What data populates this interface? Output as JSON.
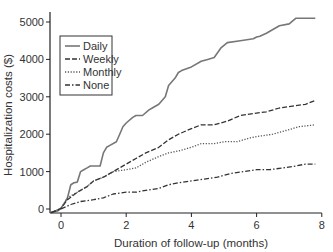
{
  "chart_data": {
    "type": "line",
    "title": "",
    "xlabel": "Duration of follow-up (months)",
    "ylabel": "Hospitalization costs ($)",
    "xlim": [
      -0.35,
      8
    ],
    "ylim": [
      -150,
      5300
    ],
    "xticks": [
      0,
      2,
      4,
      6,
      8
    ],
    "yticks": [
      0,
      1000,
      2000,
      3000,
      4000,
      5000
    ],
    "grid": false,
    "legend_position": "upper left",
    "series": [
      {
        "name": "Daily",
        "style": "solid",
        "color": "#777777",
        "x": [
          -0.3,
          -0.1,
          0.0,
          0.1,
          0.2,
          0.3,
          0.4,
          0.5,
          0.6,
          0.7,
          0.8,
          0.9,
          1.0,
          1.2,
          1.3,
          1.4,
          1.5,
          1.7,
          1.8,
          1.9,
          2.0,
          2.2,
          2.3,
          2.5,
          2.7,
          2.8,
          3.0,
          3.2,
          3.3,
          3.5,
          3.6,
          3.7,
          4.0,
          4.3,
          4.5,
          4.7,
          4.9,
          5.1,
          5.5,
          5.9,
          6.0,
          6.1,
          6.3,
          6.5,
          6.7,
          7.0,
          7.2,
          7.5,
          7.8
        ],
        "y": [
          -100,
          -50,
          20,
          150,
          300,
          650,
          700,
          720,
          1000,
          1050,
          1100,
          1150,
          1150,
          1150,
          1500,
          1650,
          1700,
          1800,
          2000,
          2200,
          2300,
          2450,
          2500,
          2500,
          2650,
          2700,
          2800,
          3000,
          3300,
          3500,
          3650,
          3700,
          3800,
          3950,
          4000,
          4050,
          4300,
          4450,
          4500,
          4550,
          4600,
          4620,
          4700,
          4800,
          4900,
          4950,
          5100,
          5100,
          5100
        ]
      },
      {
        "name": "Weekly",
        "style": "dashed",
        "color": "#333333",
        "x": [
          -0.3,
          0.0,
          0.2,
          0.5,
          0.8,
          1.0,
          1.3,
          1.6,
          2.0,
          2.3,
          2.6,
          3.0,
          3.3,
          3.6,
          4.0,
          4.3,
          4.7,
          5.1,
          5.5,
          5.9,
          6.3,
          6.7,
          7.1,
          7.5,
          7.8
        ],
        "y": [
          -100,
          20,
          250,
          450,
          600,
          750,
          850,
          1000,
          1200,
          1350,
          1500,
          1650,
          1850,
          2000,
          2150,
          2250,
          2250,
          2350,
          2500,
          2550,
          2600,
          2700,
          2750,
          2800,
          2900
        ]
      },
      {
        "name": "Monthly",
        "style": "dotted",
        "color": "#555555",
        "x": [
          -0.3,
          0.0,
          0.2,
          0.5,
          0.8,
          1.0,
          1.3,
          1.6,
          2.0,
          2.3,
          2.6,
          3.0,
          3.3,
          3.6,
          4.0,
          4.3,
          4.7,
          5.0,
          5.4,
          5.8,
          6.1,
          6.5,
          6.9,
          7.3,
          7.8
        ],
        "y": [
          -100,
          20,
          300,
          450,
          600,
          750,
          850,
          1000,
          1050,
          1100,
          1250,
          1400,
          1500,
          1550,
          1650,
          1750,
          1750,
          1800,
          1800,
          1900,
          1950,
          2000,
          2100,
          2200,
          2250
        ]
      },
      {
        "name": "None",
        "style": "dashdot",
        "color": "#333333",
        "x": [
          -0.3,
          0.0,
          0.3,
          0.6,
          1.0,
          1.3,
          1.6,
          2.0,
          2.3,
          2.6,
          3.0,
          3.3,
          3.6,
          4.0,
          4.4,
          4.8,
          5.2,
          5.6,
          6.0,
          6.4,
          6.8,
          7.2,
          7.5,
          7.8
        ],
        "y": [
          -100,
          0,
          120,
          200,
          250,
          300,
          400,
          450,
          450,
          500,
          550,
          650,
          700,
          750,
          800,
          850,
          950,
          1000,
          1050,
          1050,
          1100,
          1150,
          1200,
          1200
        ]
      }
    ]
  }
}
